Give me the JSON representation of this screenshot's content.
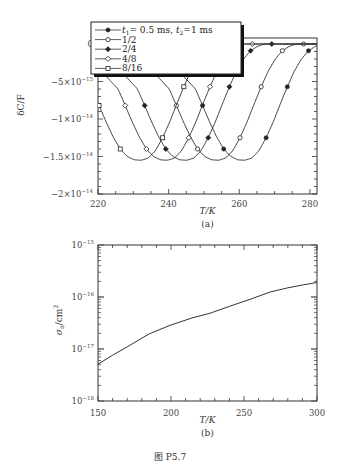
{
  "chart_data": [
    {
      "id": "a",
      "type": "line",
      "title": "",
      "panel_label": "(a)",
      "xlabel": "T/K",
      "ylabel": "δC/F",
      "xlim": [
        220,
        282
      ],
      "ylim": [
        -2e-14,
        8e-16
      ],
      "xticks": [
        220,
        240,
        260,
        280
      ],
      "xtick_labels": [
        "220",
        "240",
        "260",
        "280"
      ],
      "yticks": [
        0,
        -5e-15,
        -1e-14,
        -1.5e-14,
        -2e-14
      ],
      "ytick_labels": [
        {
          "mant": "0",
          "exp": ""
        },
        {
          "mant": "−5×10",
          "exp": "−15"
        },
        {
          "mant": "−1×10",
          "exp": "−14"
        },
        {
          "mant": "−1.5×10",
          "exp": "−14"
        },
        {
          "mant": "−2×10",
          "exp": "−14"
        }
      ],
      "legend": {
        "placement": "top-left",
        "entries": [
          {
            "label_prefix": "t",
            "label": "₁= 0.5 ms, t₂=1 ms",
            "full": "t1= 0.5 ms, t2=1 ms",
            "marker": "filled-circle"
          },
          {
            "label": "1/2",
            "marker": "open-circle"
          },
          {
            "label": "2/4",
            "marker": "filled-diamond"
          },
          {
            "label": "4/8",
            "marker": "open-diamond"
          },
          {
            "label": "8/16",
            "marker": "open-square"
          }
        ]
      },
      "series": [
        {
          "name": "t1=0.5 ms, t2=1 ms",
          "marker": "filled-circle",
          "t_min": 261.6,
          "min_value": -1.55e-14
        },
        {
          "name": "1/2",
          "marker": "open-circle",
          "t_min": 254.2,
          "min_value": -1.55e-14
        },
        {
          "name": "2/4",
          "marker": "filled-diamond",
          "t_min": 245.2,
          "min_value": -1.55e-14
        },
        {
          "name": "4/8",
          "marker": "open-diamond",
          "t_min": 239.7,
          "min_value": -1.55e-14
        },
        {
          "name": "8/16",
          "marker": "open-square",
          "t_min": 232.3,
          "min_value": -1.55e-14
        }
      ],
      "curve_shape": {
        "offset_K": [
          -30,
          -26,
          -22,
          -18,
          -14,
          -12,
          -10,
          -8,
          -6,
          -4,
          -2,
          0,
          2,
          4,
          6,
          8,
          10,
          12,
          14,
          16,
          18,
          20,
          22,
          26,
          30
        ],
        "value_e14": [
          -0.0,
          -0.05,
          -0.2,
          -0.4,
          -0.6,
          -0.82,
          -1.04,
          -1.24,
          -1.4,
          -1.5,
          -1.545,
          -1.55,
          -1.52,
          -1.42,
          -1.25,
          -1.04,
          -0.8,
          -0.57,
          -0.36,
          -0.2,
          -0.09,
          -0.03,
          0.0,
          0.0,
          0.0
        ]
      }
    },
    {
      "id": "b",
      "type": "line",
      "title": "",
      "panel_label": "(b)",
      "xlabel": "T/K",
      "ylabel": "σn/cm²",
      "yscale": "log",
      "xlim": [
        150,
        300
      ],
      "ylim": [
        1e-18,
        1e-15
      ],
      "xticks": [
        150,
        200,
        250,
        300
      ],
      "xtick_labels": [
        "150",
        "200",
        "250",
        "300"
      ],
      "yticks": [
        1e-15,
        1e-16,
        1e-17,
        1e-18
      ],
      "ytick_labels": [
        {
          "mant": "10",
          "exp": "−15"
        },
        {
          "mant": "10",
          "exp": "−16"
        },
        {
          "mant": "10",
          "exp": "−17"
        },
        {
          "mant": "10",
          "exp": "−18"
        }
      ],
      "series": [
        {
          "name": "σn",
          "x": [
            150,
            160,
            170,
            185,
            200,
            215,
            227,
            240,
            255,
            268,
            280,
            290,
            300
          ],
          "y": [
            5.1e-18,
            7.6e-18,
            1.1e-17,
            1.95e-17,
            2.9e-17,
            4e-17,
            4.9e-17,
            6.6e-17,
            9.2e-17,
            1.25e-16,
            1.5e-16,
            1.7e-16,
            1.9e-16
          ]
        }
      ]
    }
  ],
  "figure_caption": "图 P5.7"
}
